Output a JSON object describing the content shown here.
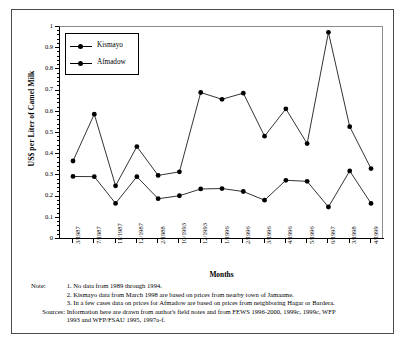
{
  "chart_data": {
    "type": "line",
    "title": "",
    "xlabel": "Months",
    "ylabel": "US$ per Liter of Camel Milk",
    "ylim": [
      0,
      1
    ],
    "ytick_step": 0.1,
    "grid": false,
    "legend_position": "top-left inside",
    "categories": [
      "3/1987",
      "7/1987",
      "11/1987",
      "12/1987",
      "2/1988",
      "10/1993",
      "12/1993",
      "1/1996",
      "2/1996",
      "3/1996",
      "4/1996",
      "5/1996",
      "6/1997",
      "3/1998",
      "4/1999"
    ],
    "ytick_labels": [
      "0",
      "0.1",
      "0.2",
      "0.3",
      "0.4",
      "0.5",
      "0.6",
      "0.7",
      "0.8",
      "0.9",
      "1"
    ],
    "series": [
      {
        "name": "Kismayo",
        "values": [
          0.295,
          0.294,
          0.168,
          0.294,
          0.19,
          0.204,
          0.236,
          0.238,
          0.224,
          0.183,
          0.277,
          0.272,
          0.151,
          0.321,
          0.168
        ]
      },
      {
        "name": "Afmadow",
        "values": [
          0.368,
          0.589,
          0.251,
          0.436,
          0.3,
          0.317,
          0.691,
          0.659,
          0.688,
          0.485,
          0.614,
          0.45,
          0.975,
          0.53,
          0.332
        ]
      }
    ]
  },
  "legend": {
    "items": [
      {
        "label": "Kismayo"
      },
      {
        "label": "Afmadow"
      }
    ]
  },
  "notes": {
    "label": "Note:",
    "items": [
      {
        "num": "1.",
        "text": "No data from 1989 through 1994."
      },
      {
        "num": "2.",
        "text": "Kismayo data from March 1998 are based on prices from nearby town of Jamaame."
      },
      {
        "num": "3.",
        "text": "In a few cases data on prices for Afmadow are based on prices from neighboring Hagar or Bardera."
      }
    ]
  },
  "sources": {
    "label": "Sources:",
    "line1": "Information here are drawn from author's field notes and from FEWS 1996-2000, 1999c, 1999c, WFP",
    "line2": "1993 and WFP/FSAU 1995, 1997a-f."
  },
  "colors": {
    "line": "#000000",
    "marker": "#000000",
    "axis": "#000000",
    "frame": "#4a4a4a",
    "plot_border_light": "#8c8c8c"
  }
}
